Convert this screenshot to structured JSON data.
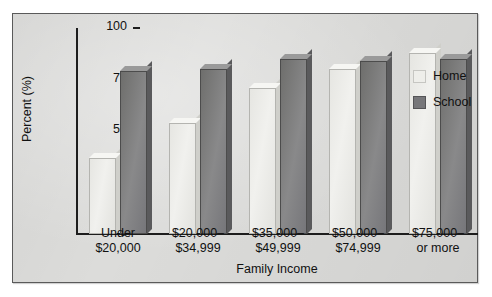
{
  "chart_data": {
    "type": "bar",
    "title": "",
    "xlabel": "Family Income",
    "ylabel": "Percent (%)",
    "ylim": [
      0,
      100
    ],
    "yticks": [
      0,
      25,
      50,
      75,
      100
    ],
    "ytick_labels": [
      "0",
      "25",
      "50",
      "75",
      "100"
    ],
    "grid": false,
    "legend_position": "right",
    "categories": [
      "Under\n$20,000",
      "$20,000–\n$34,999",
      "$35,000–\n$49,999",
      "$50,000–\n$74,999",
      "$75,000–\nor more"
    ],
    "category_lines": [
      [
        "Under",
        "$20,000"
      ],
      [
        "$20,000–",
        "$34,999"
      ],
      [
        "$35,000–",
        "$49,999"
      ],
      [
        "$50,000–",
        "$74,999"
      ],
      [
        "$75,000–",
        "or more"
      ]
    ],
    "series": [
      {
        "name": "Home",
        "color": "#eeeeea",
        "values": [
          37,
          54,
          71,
          80,
          88
        ]
      },
      {
        "name": "School",
        "color": "#77777a",
        "values": [
          79,
          80,
          85,
          84,
          85
        ]
      }
    ]
  },
  "legend": {
    "items": [
      {
        "label": "Home"
      },
      {
        "label": "School"
      }
    ]
  },
  "colors": {
    "panel_background": "#dcdcda",
    "frame": "#5a5a5a",
    "axis": "#1d1d1d",
    "home_bar": "#eeeeea",
    "school_bar": "#77777a",
    "text": "#111111"
  }
}
